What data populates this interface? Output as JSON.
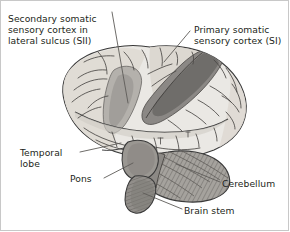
{
  "figure": {
    "background_color": "#ffffff",
    "border_color": "#c8c8c8",
    "ink_color": "#231f20"
  },
  "labels": [
    {
      "id": "sii",
      "name": "secondary-somatic-sensory-cortex-label",
      "text": "Secondary somatic\nsensory cortex in\nlateral sulcus (SII)"
    },
    {
      "id": "si",
      "name": "primary-somatic-sensory-cortex-label",
      "text": "Primary somatic\nsensory cortex (SI)"
    },
    {
      "id": "temporal",
      "name": "temporal-lobe-label",
      "text": "Temporal\nlobe"
    },
    {
      "id": "pons",
      "name": "pons-label",
      "text": "Pons"
    },
    {
      "id": "cerebellum",
      "name": "cerebellum-label",
      "text": "Cerebellum"
    },
    {
      "id": "brainstem",
      "name": "brain-stem-label",
      "text": "Brain stem"
    }
  ],
  "anatomy": {
    "cerebrum_fill": "#e8e6e2",
    "cerebrum_shade": "#d2cfc9",
    "si_band_fill": "#8a8a8a",
    "sii_region_fill": "#b0aeaa",
    "sulcus_band_fill": "#9b9894",
    "cerebellum_fill": "#9e9b96",
    "brainstem_fill": "#8d8a86",
    "outline_color": "#3a3a3a",
    "leader_color": "#5a5a5a"
  }
}
